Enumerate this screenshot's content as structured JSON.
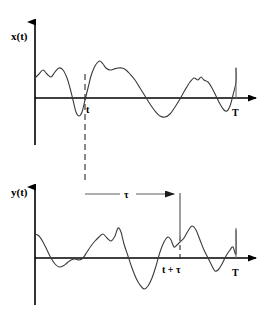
{
  "figure": {
    "title": "",
    "background_color": "#ffffff",
    "stroke_color": "#000000",
    "signal_color": "#3a3a3a",
    "guide_color": "#7a7a7a",
    "width": 270,
    "height": 314
  },
  "panels": {
    "top": {
      "name": "x-of-t-panel",
      "axis_label": "x(t)",
      "tick_labels": {
        "t": "t",
        "T": "T"
      },
      "origin": {
        "x": 35,
        "y": 98
      },
      "x_axis_end": 262,
      "y_axis_top": 20,
      "y_axis_bottom": 145,
      "marker_t_x": 85,
      "marker_T_x": 236
    },
    "bottom": {
      "name": "y-of-t-panel",
      "axis_label": "y(t)",
      "tick_labels": {
        "t_plus_tau": "t + τ",
        "T": "T"
      },
      "origin": {
        "x": 35,
        "y": 258
      },
      "x_axis_end": 262,
      "y_axis_top": 185,
      "y_axis_bottom": 305,
      "marker_t_plus_tau_x": 180,
      "marker_T_x": 236
    }
  },
  "annotations": {
    "lag_label": "τ",
    "lag_label_x": 127,
    "lag_label_y": 197,
    "lag_arrow_start_x": 85,
    "lag_arrow_end_x": 180,
    "lag_arrow_y": 194
  },
  "chart_data": {
    "type": "line",
    "title": "",
    "xlabel": "",
    "ylabel": "",
    "grid": false,
    "legend": "none",
    "axis_style": "arrowed-cartesian",
    "series": [
      {
        "name": "x(t)",
        "panel": "top",
        "xlabel": "t",
        "ylabel": "x(t)",
        "x_tick_values": [
          "t",
          "T"
        ],
        "points": [
          [
            35,
            78
          ],
          [
            39,
            74
          ],
          [
            43,
            70
          ],
          [
            47,
            74
          ],
          [
            51,
            77
          ],
          [
            55,
            72
          ],
          [
            59,
            68
          ],
          [
            63,
            70
          ],
          [
            67,
            78
          ],
          [
            70,
            88
          ],
          [
            73,
            100
          ],
          [
            76,
            112
          ],
          [
            79,
            116
          ],
          [
            82,
            112
          ],
          [
            85,
            100
          ],
          [
            88,
            88
          ],
          [
            91,
            76
          ],
          [
            94,
            68
          ],
          [
            97,
            63
          ],
          [
            100,
            61
          ],
          [
            103,
            64
          ],
          [
            106,
            68
          ],
          [
            110,
            70
          ],
          [
            114,
            69
          ],
          [
            118,
            68
          ],
          [
            122,
            68
          ],
          [
            126,
            70
          ],
          [
            130,
            74
          ],
          [
            135,
            80
          ],
          [
            140,
            88
          ],
          [
            145,
            96
          ],
          [
            150,
            104
          ],
          [
            155,
            111
          ],
          [
            160,
            116
          ],
          [
            165,
            117
          ],
          [
            170,
            114
          ],
          [
            175,
            107
          ],
          [
            180,
            99
          ],
          [
            185,
            90
          ],
          [
            190,
            82
          ],
          [
            194,
            78
          ],
          [
            198,
            80
          ],
          [
            201,
            77
          ],
          [
            204,
            80
          ],
          [
            208,
            82
          ],
          [
            212,
            88
          ],
          [
            216,
            96
          ],
          [
            220,
            104
          ],
          [
            224,
            110
          ],
          [
            227,
            111
          ],
          [
            230,
            106
          ],
          [
            233,
            95
          ],
          [
            236,
            82
          ],
          [
            236,
            68
          ]
        ],
        "baseline_y": 98
      },
      {
        "name": "y(t)",
        "panel": "bottom",
        "xlabel": "t",
        "ylabel": "y(t)",
        "x_tick_values": [
          "t + τ",
          "T"
        ],
        "points": [
          [
            35,
            234
          ],
          [
            39,
            236
          ],
          [
            43,
            242
          ],
          [
            47,
            250
          ],
          [
            51,
            258
          ],
          [
            55,
            264
          ],
          [
            59,
            267
          ],
          [
            63,
            266
          ],
          [
            67,
            263
          ],
          [
            71,
            260
          ],
          [
            75,
            259
          ],
          [
            79,
            260
          ],
          [
            83,
            258
          ],
          [
            87,
            252
          ],
          [
            91,
            246
          ],
          [
            95,
            241
          ],
          [
            99,
            237
          ],
          [
            103,
            234
          ],
          [
            107,
            238
          ],
          [
            111,
            241
          ],
          [
            115,
            236
          ],
          [
            118,
            228
          ],
          [
            121,
            232
          ],
          [
            124,
            244
          ],
          [
            128,
            256
          ],
          [
            132,
            268
          ],
          [
            136,
            278
          ],
          [
            140,
            285
          ],
          [
            144,
            289
          ],
          [
            148,
            286
          ],
          [
            152,
            278
          ],
          [
            156,
            266
          ],
          [
            160,
            252
          ],
          [
            164,
            242
          ],
          [
            168,
            237
          ],
          [
            171,
            240
          ],
          [
            174,
            247
          ],
          [
            177,
            245
          ],
          [
            180,
            242
          ],
          [
            184,
            238
          ],
          [
            188,
            231
          ],
          [
            192,
            226
          ],
          [
            196,
            230
          ],
          [
            200,
            240
          ],
          [
            204,
            250
          ],
          [
            208,
            258
          ],
          [
            212,
            266
          ],
          [
            215,
            271
          ],
          [
            218,
            270
          ],
          [
            222,
            264
          ],
          [
            226,
            256
          ],
          [
            230,
            250
          ],
          [
            233,
            247
          ],
          [
            236,
            254
          ],
          [
            236,
            230
          ]
        ],
        "baseline_y": 258
      }
    ]
  }
}
